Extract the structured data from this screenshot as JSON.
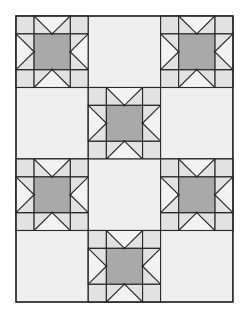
{
  "diagram": {
    "type": "quilt-layout",
    "pattern_name": "Sawtooth Star",
    "grid": {
      "cols": 3,
      "rows": 4
    },
    "origin": {
      "x": 16,
      "y": 16
    },
    "block_size": {
      "w": 72.3,
      "h": 71.5
    },
    "layout": [
      [
        "star",
        "plain",
        "star"
      ],
      [
        "plain",
        "star",
        "plain"
      ],
      [
        "star",
        "plain",
        "star"
      ],
      [
        "plain",
        "star",
        "plain"
      ]
    ],
    "colors": {
      "background": "#ffffff",
      "plain_block": "#efefef",
      "star_background": "#e2e2e2",
      "star_point": "#f3f3f3",
      "center_square": "#a9a9a9",
      "line": "#2a2a2a"
    },
    "line_width": 1.1
  }
}
